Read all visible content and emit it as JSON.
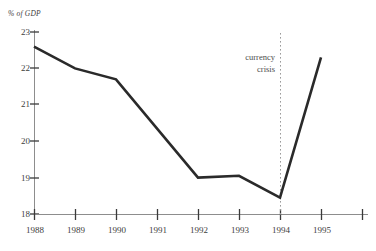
{
  "chart_data": {
    "type": "line",
    "title": "",
    "subtitle": "",
    "ylabel": "% of GDP",
    "xlabel": "",
    "x": [
      1988,
      1989,
      1990,
      1992,
      1993,
      1994,
      1995
    ],
    "values": [
      22.6,
      22.0,
      21.7,
      19.0,
      19.05,
      18.45,
      22.3
    ],
    "series": [
      {
        "name": "% of GDP",
        "x": [
          1988,
          1989,
          1990,
          1992,
          1993,
          1994,
          1995
        ],
        "values": [
          22.6,
          22.0,
          21.7,
          19.0,
          19.05,
          18.45,
          22.3
        ]
      }
    ],
    "xlim": [
      1988,
      1996
    ],
    "ylim": [
      18,
      23
    ],
    "grid": false,
    "legend": false,
    "legend_position": "none",
    "y_ticks": [
      "23",
      "22",
      "21",
      "20",
      "19",
      "18"
    ],
    "y_tick_values": [
      23,
      22,
      21,
      20,
      19,
      18
    ],
    "x_ticks": [
      "1988",
      "1989",
      "1990",
      "1991",
      "1992",
      "1993",
      "1994",
      "1995",
      ""
    ],
    "x_tick_values": [
      1988,
      1989,
      1990,
      1991,
      1992,
      1993,
      1994,
      1995,
      1996
    ],
    "annotations": [
      {
        "name": "currency-crisis",
        "line1": "currency",
        "line2": "crisis",
        "at_x": 1994,
        "style": "dotted-vertical-line"
      }
    ],
    "colors": {
      "data_line": "#2a2a2a",
      "axis": "#8d8d8d",
      "tick": "#3a3a3a",
      "event_line": "#9a9a9a",
      "text": "#3d3d3d",
      "background": "#ffffff"
    }
  }
}
